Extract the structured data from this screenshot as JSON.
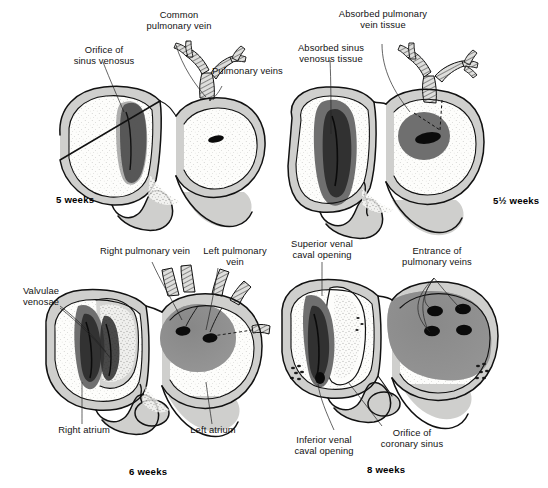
{
  "figure": {
    "panels": [
      {
        "id": "panel-5-weeks",
        "stage_label": "5 weeks",
        "labels": [
          {
            "name": "orifice-of-sinus-venosus",
            "text": "Orifice of\nsinus venosus"
          },
          {
            "name": "common-pulmonary-vein",
            "text": "Common\npulmonary vein"
          },
          {
            "name": "pulmonary-veins",
            "text": "Pulmonary veins"
          }
        ]
      },
      {
        "id": "panel-5-half-weeks",
        "stage_label": "5½ weeks",
        "labels": [
          {
            "name": "absorbed-sinus-venosus-tissue",
            "text": "Absorbed sinus\nvenosus tissue"
          },
          {
            "name": "absorbed-pulmonary-vein-tissue",
            "text": "Absorbed pulmonary\nvein tissue"
          }
        ]
      },
      {
        "id": "panel-6-weeks",
        "stage_label": "6 weeks",
        "labels": [
          {
            "name": "valvulae-venosae",
            "text": "Valvulae\nvenosae"
          },
          {
            "name": "right-pulmonary-vein",
            "text": "Right pulmonary vein"
          },
          {
            "name": "left-pulmonary-vein",
            "text": "Left pulmonary\nvein"
          },
          {
            "name": "right-atrium",
            "text": "Right atrium"
          },
          {
            "name": "left-atrium",
            "text": "Left atrium"
          }
        ]
      },
      {
        "id": "panel-8-weeks",
        "stage_label": "8 weeks",
        "labels": [
          {
            "name": "superior-venal-caval-opening",
            "text": "Superior venal\ncaval opening"
          },
          {
            "name": "entrance-of-pulmonary-veins",
            "text": "Entrance of\npulmonary veins"
          },
          {
            "name": "inferior-venal-caval-opening",
            "text": "Inferior venal\ncaval opening"
          },
          {
            "name": "orifice-of-coronary-sinus",
            "text": "Orifice of\ncoronary sinus"
          }
        ]
      }
    ],
    "colors": {
      "background": "#ffffff",
      "wall": "#cfcfcd",
      "lumen": "#fdfdfb",
      "mid_gray_tissue": "#8e8e8e",
      "dark_gray_tissue": "#6f6f6f",
      "very_dark_tissue": "#2a2a2a",
      "opening_black": "#0b0b0b",
      "outline": "#111111",
      "text": "#121212"
    }
  }
}
